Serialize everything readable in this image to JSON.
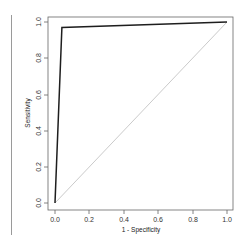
{
  "chart_data": {
    "type": "line",
    "title": "",
    "xlabel": "1 - Specificity",
    "ylabel": "Sensitivity",
    "xlim": [
      0.0,
      1.0
    ],
    "ylim": [
      0.0,
      1.0
    ],
    "x_ticks": [
      "0.0",
      "0.2",
      "0.4",
      "0.6",
      "0.8",
      "1.0"
    ],
    "y_ticks": [
      "0.0",
      "0.2",
      "0.4",
      "0.6",
      "0.8",
      "1.0"
    ],
    "grid": false,
    "legend": null,
    "series": [
      {
        "name": "ROC curve",
        "color": "#222222",
        "x": [
          0.0,
          0.04,
          1.0
        ],
        "y": [
          0.0,
          0.97,
          1.0
        ]
      },
      {
        "name": "reference diagonal",
        "color": "#bbbbbb",
        "x": [
          0.0,
          1.0
        ],
        "y": [
          0.0,
          1.0
        ]
      }
    ]
  },
  "labels": {
    "xlabel": "1 - Specificity",
    "ylabel": "Sensitivity",
    "x_ticks": [
      "0.0",
      "0.2",
      "0.4",
      "0.6",
      "0.8",
      "1.0"
    ],
    "y_ticks": [
      "0.0",
      "0.2",
      "0.4",
      "0.6",
      "0.8",
      "1.0"
    ]
  }
}
